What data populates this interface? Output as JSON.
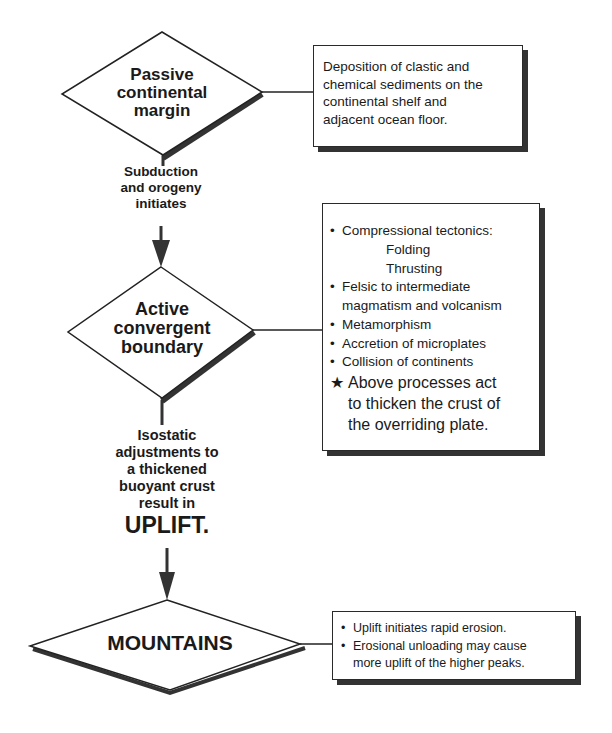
{
  "diagram": {
    "nodes": [
      {
        "id": "passive",
        "shape": "diamond",
        "lines": [
          "Passive",
          "continental",
          "margin"
        ]
      },
      {
        "id": "active",
        "shape": "diamond",
        "lines": [
          "Active",
          "convergent",
          "boundary"
        ]
      },
      {
        "id": "mountains",
        "shape": "diamond",
        "lines": [
          "MOUNTAINS"
        ]
      }
    ],
    "edges": [
      {
        "from": "passive",
        "to": "active",
        "label_lines": [
          "Subduction",
          "and orogeny",
          "initiates"
        ]
      },
      {
        "from": "active",
        "to": "mountains",
        "label_lines": [
          "Isostatic",
          "adjustments to",
          "a thickened",
          "buoyant crust",
          "result in"
        ],
        "emphasis": "UPLIFT."
      }
    ],
    "notes": {
      "passive": {
        "lines": [
          "Deposition of clastic and",
          "chemical sediments on the",
          "continental shelf and",
          "adjacent ocean floor."
        ]
      },
      "active": {
        "bullet_symbol": "•",
        "items": [
          {
            "text": "Compressional tectonics:",
            "sub": [
              "Folding",
              "Thrusting"
            ]
          },
          {
            "text": "Felsic to intermediate",
            "cont": "magmatism and volcanism"
          },
          {
            "text": "Metamorphism"
          },
          {
            "text": "Accretion of microplates"
          },
          {
            "text": "Collision of continents"
          }
        ],
        "star_symbol": "★",
        "star_lines": [
          "Above processes act",
          "to thicken the crust of",
          "the overriding plate."
        ]
      },
      "mountains": {
        "bullet_symbol": "•",
        "items": [
          {
            "text": "Uplift initiates rapid erosion."
          },
          {
            "text": "Erosional unloading may cause",
            "cont": "more uplift of the higher peaks."
          }
        ]
      }
    }
  }
}
